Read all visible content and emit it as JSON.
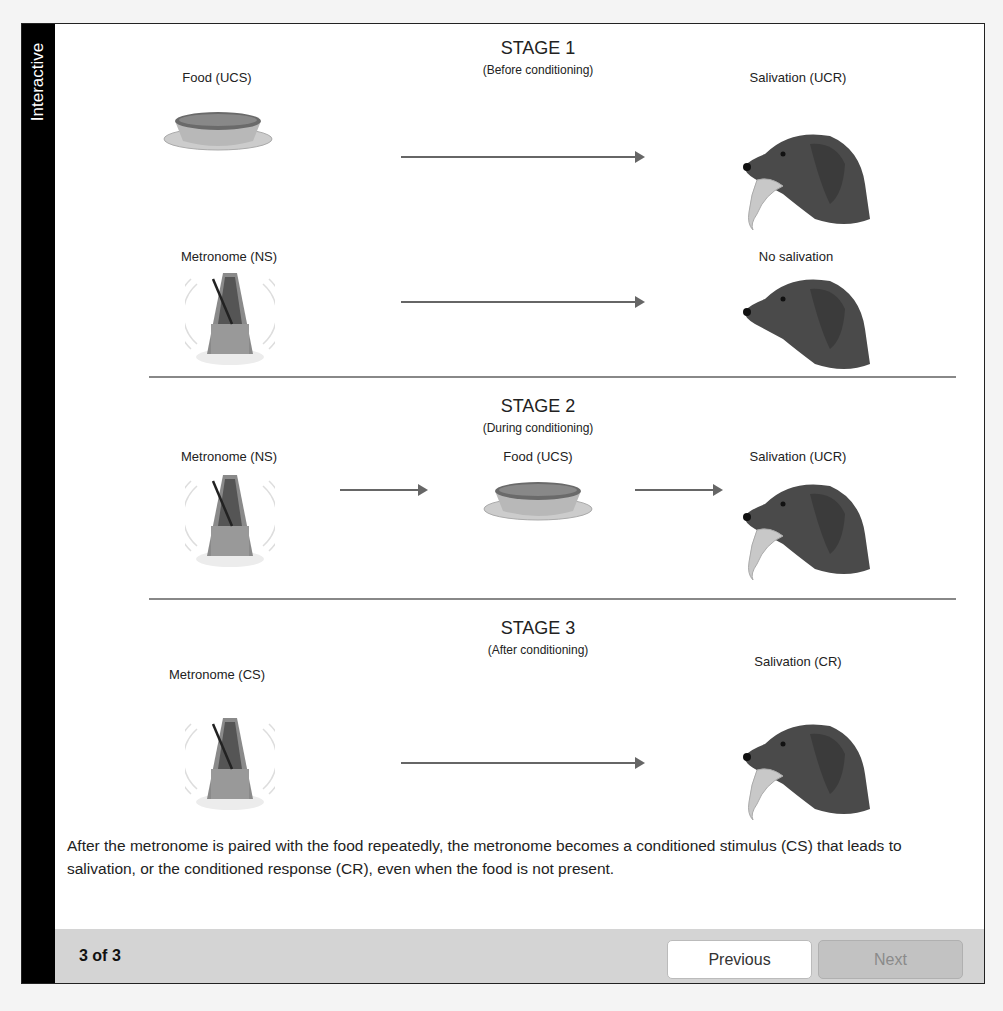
{
  "sidebar": {
    "label": "Interactive"
  },
  "stages": [
    {
      "title": "STAGE 1",
      "subtitle": "(Before conditioning)",
      "rows": [
        {
          "stimulus": "Food (UCS)",
          "response": "Salivation (UCR)"
        },
        {
          "stimulus": "Metronome (NS)",
          "response": "No salivation"
        }
      ]
    },
    {
      "title": "STAGE 2",
      "subtitle": "(During conditioning)",
      "rows": [
        {
          "stimulus": "Metronome (NS)",
          "middle": "Food (UCS)",
          "response": "Salivation (UCR)"
        }
      ]
    },
    {
      "title": "STAGE 3",
      "subtitle": "(After conditioning)",
      "rows": [
        {
          "stimulus": "Metronome (CS)",
          "response": "Salivation (CR)"
        }
      ]
    }
  ],
  "caption": "After the metronome is paired with the food repeatedly, the metronome becomes a conditioned stimulus (CS) that leads to salivation, or the conditioned response (CR), even when the food is not present.",
  "footer": {
    "page_indicator": "3 of 3",
    "previous_label": "Previous",
    "next_label": "Next"
  },
  "icons": [
    "food-bowl-icon",
    "metronome-icon",
    "dog-head-icon",
    "arrow-right-icon"
  ]
}
